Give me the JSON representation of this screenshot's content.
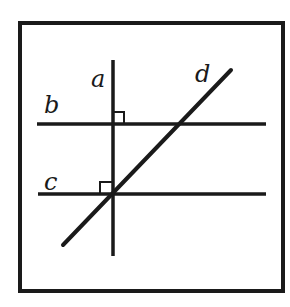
{
  "diagram": {
    "colors": {
      "stroke": "#1a1a1a",
      "background": "#ffffff"
    },
    "frame": {
      "x1": 20,
      "y1": 23,
      "x2": 283,
      "y2": 291
    },
    "lines": {
      "a": {
        "label": "a",
        "x1": 113,
        "y1": 60,
        "x2": 113,
        "y2": 256,
        "label_x": 92,
        "label_y": 86
      },
      "b": {
        "label": "b",
        "x1": 37,
        "y1": 124,
        "x2": 266,
        "y2": 124,
        "label_x": 45,
        "label_y": 112
      },
      "c": {
        "label": "c",
        "x1": 38,
        "y1": 194,
        "x2": 266,
        "y2": 194,
        "label_x": 45,
        "label_y": 189
      },
      "d": {
        "label": "d",
        "x1": 63,
        "y1": 245,
        "x2": 231,
        "y2": 70,
        "label_x": 196,
        "label_y": 81
      }
    },
    "right_angle_marks": [
      {
        "at": "a-b",
        "x": 113,
        "y": 112,
        "size": 11,
        "side": "upper-right"
      },
      {
        "at": "a-c",
        "x": 101,
        "y": 182,
        "size": 12,
        "side": "upper-left"
      }
    ]
  }
}
